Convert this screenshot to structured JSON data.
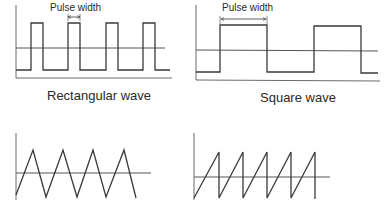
{
  "colors": {
    "line": "#3a3a3a",
    "axis": "#6a6a6a",
    "text": "#2a2a2a",
    "background": "#ffffff"
  },
  "panels": [
    {
      "id": "rectangular",
      "caption": "Rectangular wave",
      "annotation": "Pulse width",
      "waveform": "rectangular",
      "pulses": [
        [
          31,
          43
        ],
        [
          68,
          80
        ],
        [
          106,
          118
        ],
        [
          143,
          155
        ]
      ],
      "levels": {
        "high": 23,
        "low": 70,
        "center": 48,
        "baseline": 78
      }
    },
    {
      "id": "square",
      "caption": "Square wave",
      "annotation": "Pulse width",
      "waveform": "square",
      "pulses": [
        [
          220,
          267
        ],
        [
          314,
          361
        ]
      ],
      "levels": {
        "high": 25,
        "low": 72,
        "center": 50,
        "baseline": 80
      }
    },
    {
      "id": "triangle",
      "caption": "",
      "waveform": "triangle",
      "points": [
        [
          16,
          195
        ],
        [
          33,
          150
        ],
        [
          46,
          197
        ],
        [
          63,
          150
        ],
        [
          77,
          197
        ],
        [
          93,
          150
        ],
        [
          106,
          197
        ],
        [
          124,
          150
        ],
        [
          136,
          198
        ]
      ],
      "levels": {
        "center": 173
      }
    },
    {
      "id": "sawtooth",
      "caption": "",
      "waveform": "sawtooth",
      "teeth_peaks_x": [
        219,
        243,
        267,
        291,
        315
      ],
      "levels": {
        "peak": 152,
        "bottom": 198,
        "center": 177
      }
    }
  ]
}
